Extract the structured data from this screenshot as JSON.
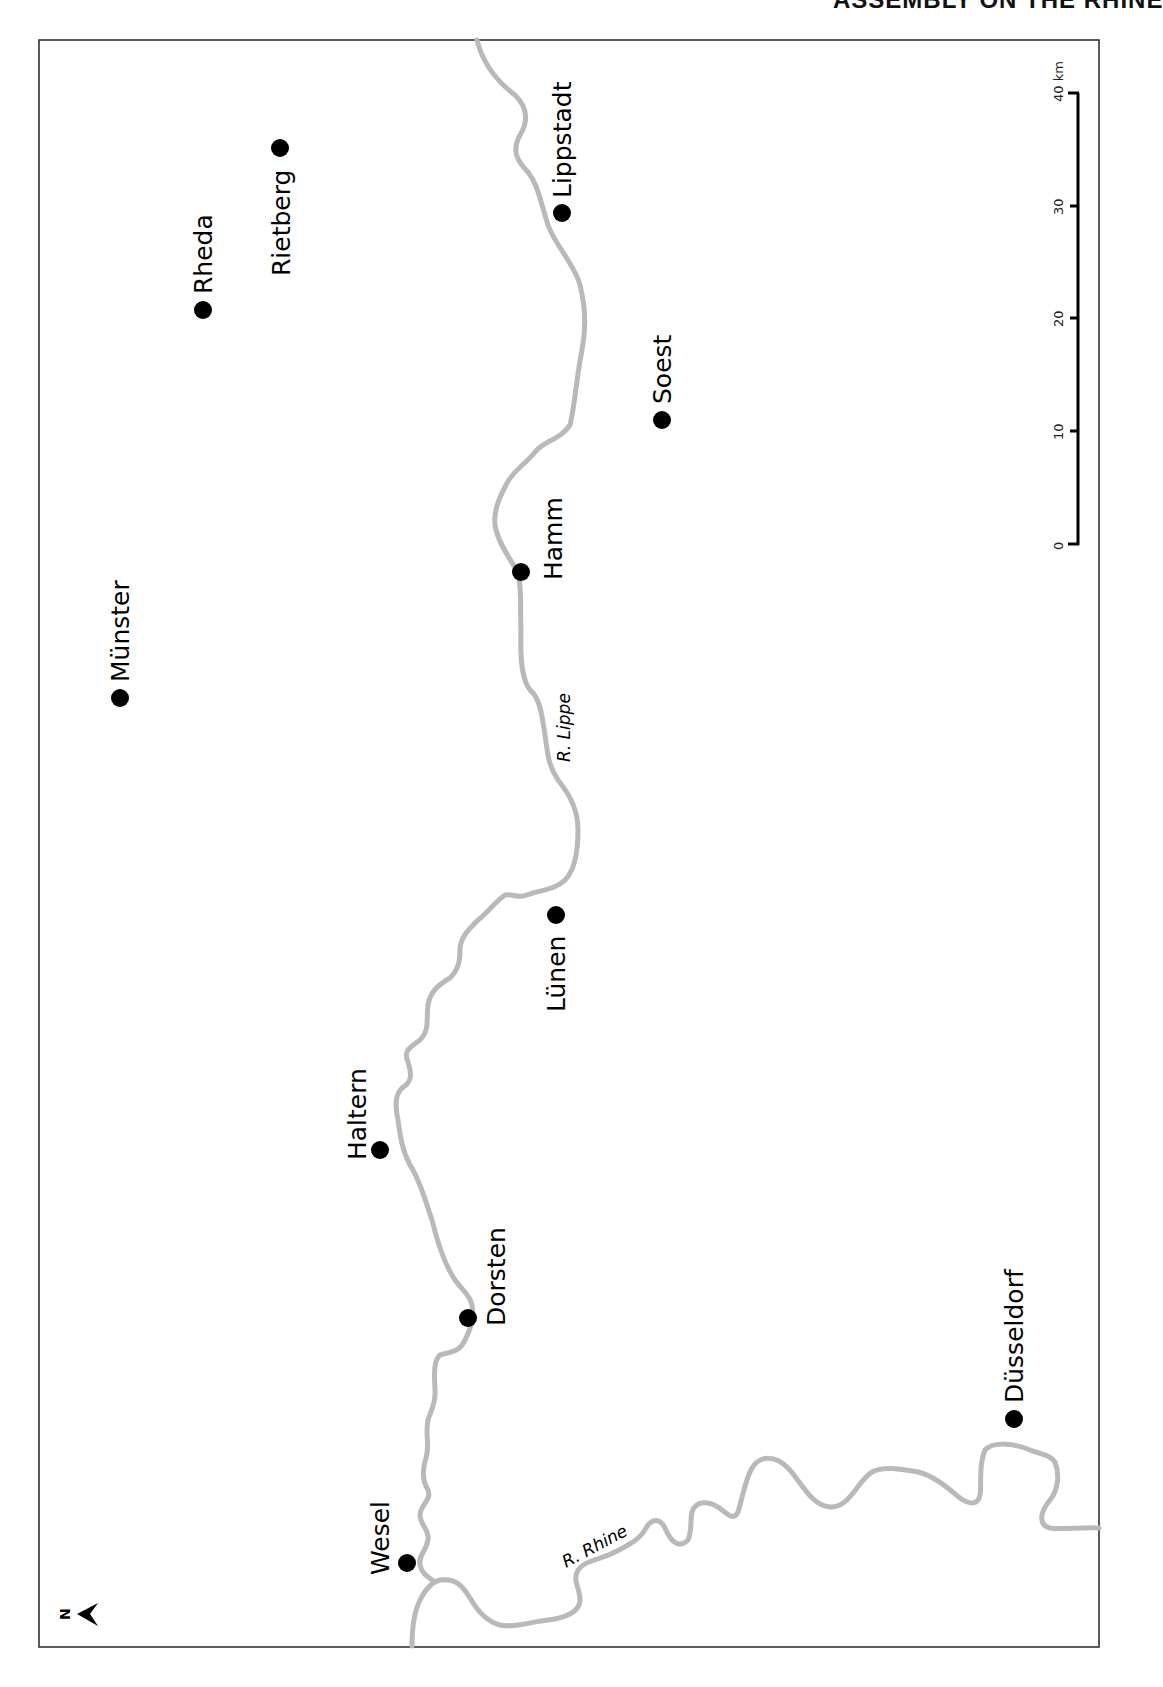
{
  "page": {
    "running_head": "ASSEMBLY ON THE RHINE"
  },
  "map": {
    "frame": {
      "left": 39,
      "top": 40,
      "right": 1099,
      "bottom": 1647
    },
    "colors": {
      "river": "#b9b9b9",
      "city": "#000000",
      "frame": "#333333"
    },
    "orientation": "rotated 90° (north points left)",
    "cities": [
      {
        "name": "Rietberg",
        "x": 280,
        "y": 148
      },
      {
        "name": "Rheda",
        "x": 203,
        "y": 310
      },
      {
        "name": "Lippstadt",
        "x": 562,
        "y": 213
      },
      {
        "name": "Soest",
        "x": 662,
        "y": 420
      },
      {
        "name": "Hamm",
        "x": 521,
        "y": 572
      },
      {
        "name": "Münster",
        "x": 120,
        "y": 698
      },
      {
        "name": "Lünen",
        "x": 556,
        "y": 915
      },
      {
        "name": "Haltern",
        "x": 380,
        "y": 1150
      },
      {
        "name": "Dorsten",
        "x": 468,
        "y": 1318
      },
      {
        "name": "Wesel",
        "x": 407,
        "y": 1563
      },
      {
        "name": "Düsseldorf",
        "x": 1014,
        "y": 1419
      }
    ],
    "rivers": [
      {
        "name": "R. Lippe",
        "label": "R. Lippe"
      },
      {
        "name": "R. Rhine",
        "label": "R. Rhine"
      }
    ],
    "scale_bar": {
      "unit": "km",
      "ticks": [
        "0",
        "10",
        "20",
        "30",
        "40 km"
      ],
      "tick_values": [
        0,
        10,
        20,
        30,
        40
      ]
    },
    "north_arrow": {
      "label": "N"
    }
  }
}
